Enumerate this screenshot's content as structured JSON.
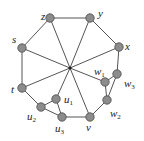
{
  "diagram": {
    "type": "graph",
    "center": {
      "x": 70,
      "y": 68
    },
    "nodes": [
      {
        "id": "z",
        "label": "z",
        "sub": "",
        "x": 50,
        "y": 18,
        "lx": 41,
        "ly": 20
      },
      {
        "id": "y",
        "label": "y",
        "sub": "",
        "x": 90,
        "y": 18,
        "lx": 98,
        "ly": 17
      },
      {
        "id": "x",
        "label": "x",
        "sub": "",
        "x": 119,
        "y": 47,
        "lx": 125,
        "ly": 50
      },
      {
        "id": "s",
        "label": "s",
        "sub": "",
        "x": 22,
        "y": 48,
        "lx": 12,
        "ly": 43
      },
      {
        "id": "t",
        "label": "t",
        "sub": "",
        "x": 22,
        "y": 88,
        "lx": 11,
        "ly": 93
      },
      {
        "id": "w1",
        "label": "w",
        "sub": "1",
        "x": 105,
        "y": 82,
        "lx": 94,
        "ly": 75
      },
      {
        "id": "w3",
        "label": "w",
        "sub": "3",
        "x": 117,
        "y": 74,
        "lx": 124,
        "ly": 87
      },
      {
        "id": "w2",
        "label": "w",
        "sub": "2",
        "x": 107,
        "y": 100,
        "lx": 110,
        "ly": 117
      },
      {
        "id": "v",
        "label": "v",
        "sub": "",
        "x": 90,
        "y": 117,
        "lx": 86,
        "ly": 131
      },
      {
        "id": "u3",
        "label": "u",
        "sub": "3",
        "x": 62,
        "y": 117,
        "lx": 55,
        "ly": 132
      },
      {
        "id": "u2",
        "label": "u",
        "sub": "2",
        "x": 41,
        "y": 107,
        "lx": 27,
        "ly": 120
      },
      {
        "id": "u1",
        "label": "u",
        "sub": "1",
        "x": 56,
        "y": 99,
        "lx": 64,
        "ly": 103
      }
    ],
    "edges": [
      [
        "z",
        "y"
      ],
      [
        "y",
        "x"
      ],
      [
        "z",
        "s"
      ],
      [
        "s",
        "t"
      ],
      [
        "x",
        "w3"
      ],
      [
        "w3",
        "w1"
      ],
      [
        "w3",
        "w2"
      ],
      [
        "w1",
        "w2"
      ],
      [
        "w2",
        "v"
      ],
      [
        "v",
        "u3"
      ],
      [
        "u3",
        "u2"
      ],
      [
        "u3",
        "u1"
      ],
      [
        "u1",
        "u2"
      ],
      [
        "u2",
        "t"
      ]
    ],
    "spokes": [
      "z",
      "y",
      "x",
      "s",
      "t",
      "w1",
      "v",
      "u1"
    ]
  }
}
